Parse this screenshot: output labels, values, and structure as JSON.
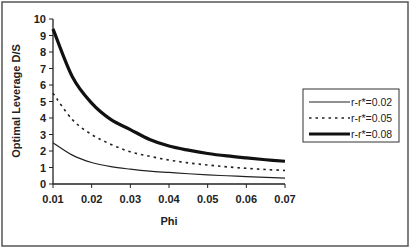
{
  "chart_data": {
    "type": "line",
    "title": "",
    "xlabel": "Phi",
    "ylabel": "Optimal Leverage D/S",
    "xlim": [
      0.01,
      0.07
    ],
    "ylim": [
      0,
      10
    ],
    "x_ticks": [
      "0.01",
      "0.02",
      "0.03",
      "0.04",
      "0.05",
      "0.06",
      "0.07"
    ],
    "y_ticks": [
      "0",
      "1",
      "2",
      "3",
      "4",
      "5",
      "6",
      "7",
      "8",
      "9",
      "10"
    ],
    "grid": false,
    "legend_position": "right",
    "x": [
      0.01,
      0.015,
      0.02,
      0.025,
      0.03,
      0.035,
      0.04,
      0.045,
      0.05,
      0.055,
      0.06,
      0.065,
      0.07
    ],
    "series": [
      {
        "name": "r-r*=0.02",
        "style": "thin-solid",
        "values": [
          2.5,
          1.75,
          1.3,
          1.05,
          0.9,
          0.78,
          0.7,
          0.62,
          0.55,
          0.5,
          0.45,
          0.4,
          0.36
        ]
      },
      {
        "name": "r-r*=0.05",
        "style": "dotted",
        "values": [
          5.5,
          3.9,
          3.0,
          2.4,
          1.95,
          1.68,
          1.45,
          1.28,
          1.15,
          1.04,
          0.95,
          0.88,
          0.82
        ]
      },
      {
        "name": "r-r*=0.08",
        "style": "thick-solid",
        "values": [
          9.4,
          6.5,
          4.9,
          3.9,
          3.3,
          2.7,
          2.3,
          2.05,
          1.85,
          1.7,
          1.58,
          1.47,
          1.38
        ]
      }
    ]
  }
}
